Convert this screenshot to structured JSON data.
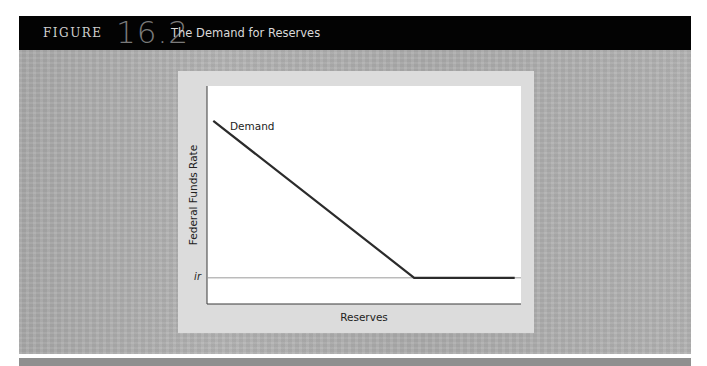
{
  "header": {
    "figure_word": "FIGURE",
    "figure_number": "16.2",
    "title": "The Demand for Reserves"
  },
  "chart_data": {
    "type": "line",
    "title": "The Demand for Reserves",
    "xlabel": "Reserves",
    "ylabel": "Federal Funds Rate",
    "series": [
      {
        "name": "Demand",
        "points": [
          {
            "x": 0.02,
            "y": 0.84
          },
          {
            "x": 0.66,
            "y": 0.12
          },
          {
            "x": 0.98,
            "y": 0.12
          }
        ]
      }
    ],
    "reference_lines": [
      {
        "axis": "y",
        "value": 0.12,
        "label": "ir"
      }
    ],
    "annotations": [
      {
        "text": "Demand",
        "near": "top-left of curve"
      }
    ],
    "xlim": [
      0,
      1
    ],
    "ylim": [
      0,
      1
    ],
    "ticks": "none",
    "grid": false,
    "legend": "none",
    "colors": {
      "curve": "#2b2b2b",
      "ir_line": "#9a9a9a",
      "plot_bg": "#ffffff",
      "panel_bg": "#dcdcdc"
    }
  }
}
